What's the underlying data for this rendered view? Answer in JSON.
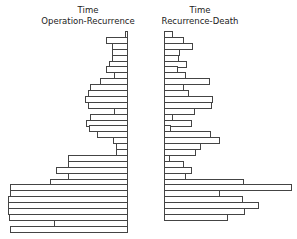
{
  "chart_data": {
    "type": "bar",
    "orientation": "horizontal",
    "layout": "back-to-back",
    "grid": false,
    "legend": null,
    "panels": [
      {
        "title_line1": "Time",
        "title_line2": "Operation-Recurrence",
        "direction": "left",
        "values": [
          3,
          22,
          16,
          16,
          16,
          19,
          22,
          14,
          28,
          38,
          40,
          43,
          40,
          14,
          38,
          42,
          39,
          31,
          15,
          12,
          12,
          60,
          60,
          72,
          60,
          78,
          118,
          118,
          120,
          120,
          120,
          119,
          74,
          118
        ]
      },
      {
        "title_line1": "Time",
        "title_line2": "Recurrence-Death",
        "direction": "right",
        "values": [
          9,
          20,
          29,
          16,
          15,
          23,
          14,
          22,
          46,
          20,
          25,
          49,
          48,
          31,
          9,
          28,
          7,
          47,
          56,
          37,
          32,
          6,
          20,
          28,
          22,
          80,
          128,
          56,
          79,
          95,
          81,
          64
        ]
      }
    ]
  }
}
